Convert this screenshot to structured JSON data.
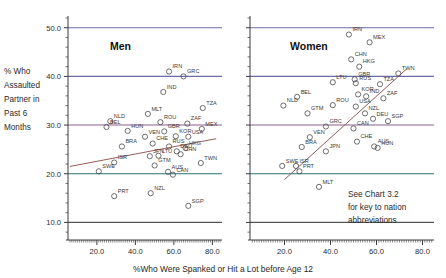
{
  "axes": {
    "ylabel_lines": [
      "% Who",
      "Assaulted",
      "Partner in",
      "Past 6",
      "Months"
    ],
    "xlabel": "%Who Were Spanked or Hit a Lot before Age 12",
    "yticks": [
      "10.0",
      "20.0",
      "30.0",
      "40.0",
      "50.0"
    ],
    "xticks": [
      "20.0",
      "40.0",
      "60.0",
      "80.0"
    ]
  },
  "note": {
    "line1": "See Chart 3.2",
    "line2": "for key to nation",
    "line3": "abbreviations"
  },
  "colors": {
    "gridline_50": "#6a6aa8",
    "gridline_40": "#6a6aa8",
    "gridline_30": "#8d5f8d",
    "gridline_20": "#2f6f6f",
    "gridline_10": "#555555",
    "marker": "#4a4a4a",
    "fitline": "#8a4a4a",
    "axis": "#3a3a3a"
  },
  "chart_data": {
    "type": "scatter",
    "title": "",
    "xlabel": "%Who Were Spanked or Hit a Lot before Age 12",
    "ylabel": "% Who Assaulted Partner in Past 6 Months",
    "xlim": [
      5.0,
      85.0
    ],
    "ylim": [
      7.0,
      52.0
    ],
    "grid": true,
    "gridlines_y": [
      10.0,
      20.0,
      30.0,
      40.0,
      50.0
    ],
    "legend_position": "none",
    "panels": [
      {
        "name": "Men",
        "title": "Men",
        "trendline": {
          "x": [
            6.0,
            82.0
          ],
          "y": [
            21.5,
            27.2
          ]
        },
        "points": [
          {
            "label": "IRN",
            "x": 57.5,
            "y": 41.0
          },
          {
            "label": "GRC",
            "x": 65.0,
            "y": 40.0
          },
          {
            "label": "IND",
            "x": 54.5,
            "y": 36.8
          },
          {
            "label": "MLT",
            "x": 46.5,
            "y": 32.3
          },
          {
            "label": "TZA",
            "x": 75.0,
            "y": 33.5
          },
          {
            "label": "NLD",
            "x": 27.0,
            "y": 30.8
          },
          {
            "label": "ROU",
            "x": 53.0,
            "y": 30.6
          },
          {
            "label": "ZAF",
            "x": 67.0,
            "y": 30.3
          },
          {
            "label": "BEL",
            "x": 25.0,
            "y": 29.6
          },
          {
            "label": "HUN",
            "x": 36.0,
            "y": 28.8
          },
          {
            "label": "GBR",
            "x": 55.0,
            "y": 28.7
          },
          {
            "label": "MEX",
            "x": 74.5,
            "y": 29.2
          },
          {
            "label": "VEN",
            "x": 45.0,
            "y": 27.6
          },
          {
            "label": "KOR",
            "x": 61.0,
            "y": 27.7
          },
          {
            "label": "USA",
            "x": 67.5,
            "y": 27.6
          },
          {
            "label": "BRA",
            "x": 33.0,
            "y": 25.6
          },
          {
            "label": "CHE",
            "x": 49.0,
            "y": 26.2
          },
          {
            "label": "RUS",
            "x": 57.5,
            "y": 25.6
          },
          {
            "label": "HKG",
            "x": 66.0,
            "y": 25.3
          },
          {
            "label": "DEU",
            "x": 61.5,
            "y": 24.6
          },
          {
            "label": "CHN",
            "x": 63.5,
            "y": 24.0
          },
          {
            "label": "JPN",
            "x": 47.5,
            "y": 23.6
          },
          {
            "label": "LTU",
            "x": 52.0,
            "y": 23.7
          },
          {
            "label": "ISR",
            "x": 29.0,
            "y": 22.3
          },
          {
            "label": "TWN",
            "x": 74.0,
            "y": 22.2
          },
          {
            "label": "GTM",
            "x": 50.0,
            "y": 21.7
          },
          {
            "label": "SWE",
            "x": 21.0,
            "y": 20.5
          },
          {
            "label": "AUS",
            "x": 57.0,
            "y": 20.4
          },
          {
            "label": "CAN",
            "x": 59.5,
            "y": 19.8
          },
          {
            "label": "PRT",
            "x": 29.0,
            "y": 15.4
          },
          {
            "label": "NZL",
            "x": 48.0,
            "y": 16.0
          },
          {
            "label": "SGP",
            "x": 67.5,
            "y": 13.4
          }
        ]
      },
      {
        "name": "Women",
        "title": "Women",
        "trendline": {
          "x": [
            20.0,
            73.0
          ],
          "y": [
            18.8,
            41.5
          ]
        },
        "points": [
          {
            "label": "IRN",
            "x": 48.0,
            "y": 48.6
          },
          {
            "label": "MEX",
            "x": 57.0,
            "y": 47.0
          },
          {
            "label": "CHN",
            "x": 49.0,
            "y": 43.5
          },
          {
            "label": "HKG",
            "x": 52.5,
            "y": 42.0
          },
          {
            "label": "TWN",
            "x": 69.5,
            "y": 40.6
          },
          {
            "label": "LTU",
            "x": 41.0,
            "y": 38.8
          },
          {
            "label": "GBR",
            "x": 50.5,
            "y": 39.4
          },
          {
            "label": "RUS",
            "x": 51.0,
            "y": 38.6
          },
          {
            "label": "TZA",
            "x": 61.5,
            "y": 38.4
          },
          {
            "label": "KOR",
            "x": 52.0,
            "y": 36.3
          },
          {
            "label": "IND",
            "x": 55.5,
            "y": 35.9
          },
          {
            "label": "ZAF",
            "x": 63.0,
            "y": 35.5
          },
          {
            "label": "BEL",
            "x": 25.5,
            "y": 35.8
          },
          {
            "label": "NLD",
            "x": 19.5,
            "y": 34.0
          },
          {
            "label": "ROU",
            "x": 41.0,
            "y": 34.1
          },
          {
            "label": "USA",
            "x": 51.0,
            "y": 33.8
          },
          {
            "label": "GTM",
            "x": 30.0,
            "y": 32.4
          },
          {
            "label": "NZL",
            "x": 55.0,
            "y": 32.4
          },
          {
            "label": "DEU",
            "x": 58.5,
            "y": 31.3
          },
          {
            "label": "SGP",
            "x": 65.0,
            "y": 30.8
          },
          {
            "label": "GRC",
            "x": 38.0,
            "y": 29.7
          },
          {
            "label": "CAN",
            "x": 50.0,
            "y": 29.3
          },
          {
            "label": "VEN",
            "x": 31.0,
            "y": 27.5
          },
          {
            "label": "CHE",
            "x": 51.5,
            "y": 26.6
          },
          {
            "label": "AUS",
            "x": 59.0,
            "y": 25.6
          },
          {
            "label": "BRA",
            "x": 27.5,
            "y": 25.5
          },
          {
            "label": "JPN",
            "x": 38.0,
            "y": 24.6
          },
          {
            "label": "HUN",
            "x": 60.5,
            "y": 25.3
          },
          {
            "label": "SWE",
            "x": 19.0,
            "y": 21.6
          },
          {
            "label": "ISR",
            "x": 25.0,
            "y": 21.6
          },
          {
            "label": "PRT",
            "x": 26.5,
            "y": 20.5
          },
          {
            "label": "MLT",
            "x": 35.0,
            "y": 17.3
          }
        ]
      }
    ]
  }
}
